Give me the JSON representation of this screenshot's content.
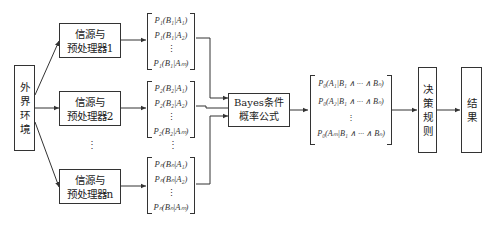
{
  "diagram": {
    "environment": {
      "label_chars": [
        "外",
        "界",
        "环",
        "境"
      ]
    },
    "preprocessors": [
      {
        "line1": "信源与",
        "line2": "预处理器1"
      },
      {
        "line1": "信源与",
        "line2": "预处理器2"
      },
      {
        "line1": "信源与",
        "line2": "预处理器n"
      }
    ],
    "ellipsis_vertical": "⋮",
    "likelihood_matrices": [
      {
        "rows": [
          "P₁(B₁|A₁)",
          "P₁(B₁|A₂)",
          "⋮",
          "P₁(B₁|Aₘ)"
        ]
      },
      {
        "rows": [
          "P₂(B₂|A₁)",
          "P₂(B₂|A₂)",
          "⋮",
          "P₂(B₂|Aₘ)"
        ]
      },
      {
        "rows": [
          "Pₙ(Bₙ|A₁)",
          "Pₙ(Bₙ|A₂)",
          "⋮",
          "Pₙ(Bₙ|Aₘ)"
        ]
      }
    ],
    "bayes": {
      "line1": "Bayes条件",
      "line2": "概率公式"
    },
    "posterior_matrix": {
      "rows": [
        "P₀(A₁|B₁ ∧ ··· ∧ Bₙ)",
        "P₀(A₂|B₁ ∧ ··· ∧ Bₙ)",
        "⋮",
        "P₀(Aₘ|B₁ ∧ ··· ∧ Bₙ)"
      ]
    },
    "decision": {
      "label_chars": [
        "决",
        "策",
        "规",
        "则"
      ]
    },
    "result": {
      "label_chars": [
        "结",
        "果"
      ]
    }
  }
}
